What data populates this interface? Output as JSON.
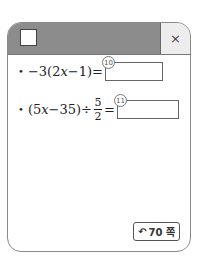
{
  "header": {
    "close_icon": "×"
  },
  "problems": [
    {
      "number": "10",
      "expr_prefix": "−3(2",
      "var": "x",
      "expr_suffix": "−1)="
    },
    {
      "number": "11",
      "expr_prefix": "(5",
      "var": "x",
      "expr_mid": "−35)÷",
      "frac_num": "5",
      "frac_den": "2",
      "expr_suffix": "="
    }
  ],
  "bullet": "•",
  "page_ref": {
    "icon": "↶",
    "label": "70 쪽"
  }
}
